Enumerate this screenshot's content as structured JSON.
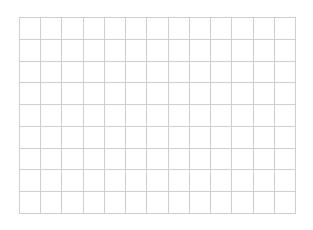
{
  "grid": {
    "columns": 13,
    "rows": 9,
    "line_color": "#cfcfcf",
    "background": "#ffffff"
  }
}
